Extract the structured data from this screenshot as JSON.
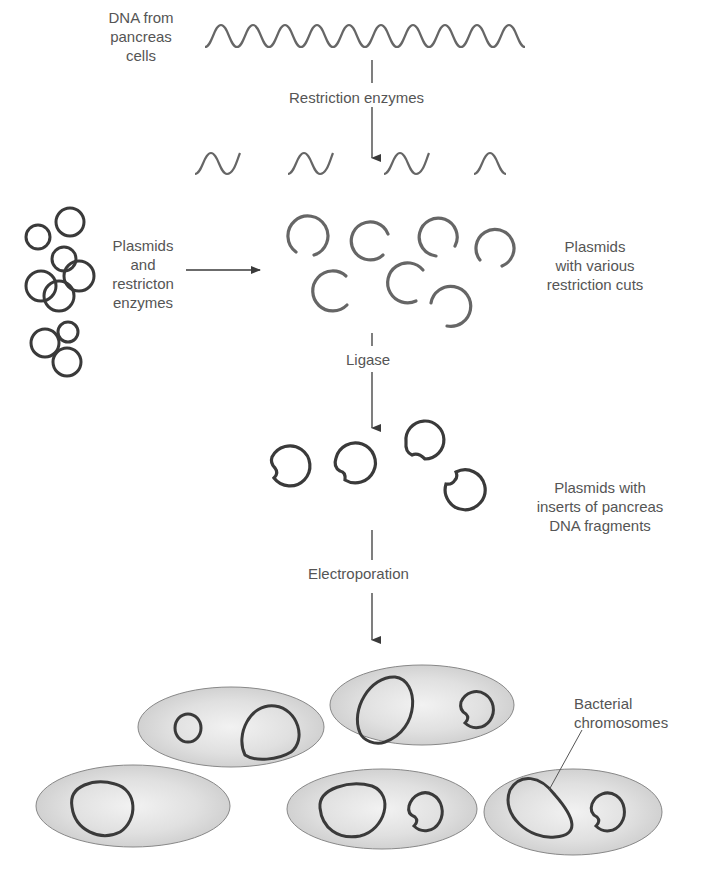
{
  "steps": {
    "source": {
      "lines": [
        "DNA from",
        "pancreas",
        "cells"
      ]
    },
    "step1": {
      "label": "Restriction enzymes"
    },
    "plasmid_source": {
      "lines": [
        "Plasmids",
        "and",
        "restricton",
        "enzymes"
      ]
    },
    "cut_plasmids": {
      "lines": [
        "Plasmids",
        "with various",
        "restriction cuts"
      ]
    },
    "step2": {
      "label": "Ligase"
    },
    "recombinant": {
      "lines": [
        "Plasmids with",
        "inserts of pancreas",
        "DNA fragments"
      ]
    },
    "step3": {
      "label": "Electroporation"
    },
    "bacteria": {
      "lines": [
        "Bacterial",
        "chromosomes"
      ]
    }
  },
  "colors": {
    "stroke": "#3a3a3a",
    "text": "#555555",
    "cell_fill": "#dcdcdc",
    "background": "#ffffff"
  }
}
